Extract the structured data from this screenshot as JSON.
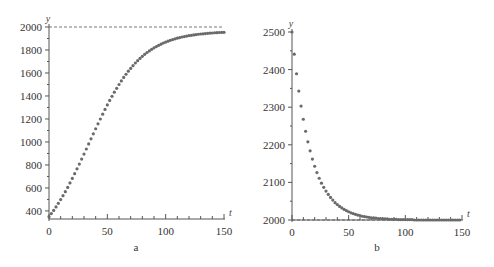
{
  "chart_data": [
    {
      "id": "a",
      "type": "scatter",
      "caption": "a",
      "title": "",
      "xlabel": "t",
      "ylabel": "y",
      "xlim": [
        0,
        150
      ],
      "ylim": [
        330,
        2000
      ],
      "xticks": [
        0,
        50,
        100,
        150
      ],
      "xtick_labels": [
        "0",
        "50",
        "100",
        "150"
      ],
      "yticks": [
        400,
        600,
        800,
        1000,
        1200,
        1400,
        1600,
        1800,
        2000
      ],
      "ytick_labels": [
        "400",
        "600",
        "800",
        "1000",
        "1200",
        "1400",
        "1600",
        "1800",
        "2000"
      ],
      "asymptote": 2000,
      "grid": false,
      "legend": "none",
      "x": [
        0,
        2,
        4,
        6,
        8,
        10,
        12,
        14,
        16,
        18,
        20,
        22,
        24,
        26,
        28,
        30,
        32,
        34,
        36,
        38,
        40,
        42,
        44,
        46,
        48,
        50,
        52,
        54,
        56,
        58,
        60,
        62,
        64,
        66,
        68,
        70,
        72,
        74,
        76,
        78,
        80,
        82,
        84,
        86,
        88,
        90,
        92,
        94,
        96,
        98,
        100,
        102,
        104,
        106,
        108,
        110,
        112,
        114,
        116,
        118,
        120,
        122,
        124,
        126,
        128,
        130,
        132,
        134,
        136,
        138,
        140,
        142,
        144,
        146,
        148,
        150
      ],
      "y": [
        350,
        377,
        405,
        435,
        466,
        499,
        533,
        568,
        605,
        644,
        683,
        724,
        766,
        808,
        851,
        895,
        939,
        983,
        1027,
        1071,
        1115,
        1158,
        1200,
        1242,
        1283,
        1322,
        1361,
        1397,
        1433,
        1467,
        1500,
        1531,
        1561,
        1589,
        1616,
        1640,
        1664,
        1687,
        1707,
        1727,
        1745,
        1762,
        1778,
        1792,
        1806,
        1819,
        1830,
        1841,
        1851,
        1861,
        1869,
        1877,
        1884,
        1891,
        1897,
        1903,
        1908,
        1913,
        1917,
        1921,
        1925,
        1928,
        1931,
        1934,
        1937,
        1939,
        1941,
        1943,
        1945,
        1947,
        1948,
        1950,
        1951,
        1952,
        1953,
        1954
      ]
    },
    {
      "id": "b",
      "type": "scatter",
      "caption": "b",
      "title": "",
      "xlabel": "t",
      "ylabel": "y",
      "xlim": [
        0,
        150
      ],
      "ylim": [
        2000,
        2500
      ],
      "xticks": [
        0,
        50,
        100,
        150
      ],
      "xtick_labels": [
        "0",
        "50",
        "100",
        "150"
      ],
      "yticks": [
        2000,
        2100,
        2200,
        2300,
        2400,
        2500
      ],
      "ytick_labels": [
        "2000",
        "2100",
        "2200",
        "2300",
        "2400",
        "2500"
      ],
      "asymptote": 2000,
      "grid": false,
      "legend": "none",
      "x": [
        0,
        2,
        4,
        6,
        8,
        10,
        12,
        14,
        16,
        18,
        20,
        22,
        24,
        26,
        28,
        30,
        32,
        34,
        36,
        38,
        40,
        42,
        44,
        46,
        48,
        50,
        52,
        54,
        56,
        58,
        60,
        62,
        64,
        66,
        68,
        70,
        72,
        74,
        76,
        78,
        80,
        82,
        84,
        86,
        88,
        90,
        92,
        94,
        96,
        98,
        100,
        102,
        104,
        106,
        108,
        110,
        112,
        114,
        116,
        118,
        120,
        122,
        124,
        126,
        128,
        130,
        132,
        134,
        136,
        138,
        140,
        142,
        144,
        146,
        148
      ],
      "y": [
        2500,
        2441,
        2389,
        2343,
        2303,
        2268,
        2236,
        2208,
        2184,
        2162,
        2143,
        2126,
        2111,
        2098,
        2087,
        2077,
        2068,
        2060,
        2053,
        2046,
        2041,
        2036,
        2032,
        2028,
        2025,
        2022,
        2019,
        2017,
        2015,
        2013,
        2012,
        2010,
        2009,
        2008,
        2007,
        2006,
        2006,
        2005,
        2004,
        2004,
        2003,
        2003,
        2003,
        2002,
        2002,
        2002,
        2002,
        2001,
        2001,
        2001,
        2001,
        2001,
        2001,
        2001,
        2000,
        2000,
        2000,
        2000,
        2000,
        2000,
        2000,
        2000,
        2000,
        2000,
        2000,
        2000,
        2000,
        2000,
        2000,
        2000,
        2000,
        2000,
        2000,
        2000,
        2000
      ]
    }
  ]
}
